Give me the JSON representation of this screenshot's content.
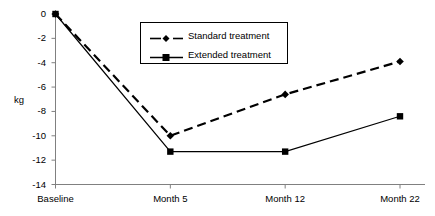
{
  "chart_data": {
    "type": "line",
    "title": "",
    "xlabel": "",
    "ylabel": "kg",
    "categories": [
      "Baseline",
      "Month 5",
      "Month 12",
      "Month 22"
    ],
    "series": [
      {
        "name": "Standard treatment",
        "values": [
          0,
          -10.0,
          -6.6,
          -3.9
        ],
        "line_style": "dashed",
        "marker": "diamond",
        "color": "#000000"
      },
      {
        "name": "Extended treatment",
        "values": [
          0,
          -11.3,
          -11.3,
          -8.4
        ],
        "line_style": "solid",
        "marker": "square",
        "color": "#000000"
      }
    ],
    "ylim": [
      -14,
      0
    ],
    "ytick_labels": [
      "0",
      "-2",
      "-4",
      "-6",
      "-8",
      "-10",
      "-12",
      "-14"
    ],
    "ytick_values": [
      0,
      -2,
      -4,
      -6,
      -8,
      -10,
      -12,
      -14
    ],
    "grid": false,
    "legend_position": "top-center"
  },
  "axes": {
    "y_label": "kg"
  },
  "legend": {
    "entries": [
      {
        "label": "Standard treatment"
      },
      {
        "label": "Extended treatment"
      }
    ]
  }
}
